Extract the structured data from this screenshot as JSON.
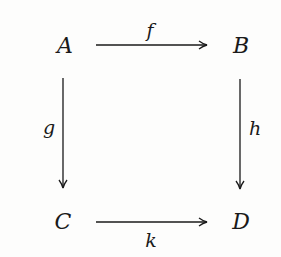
{
  "diagram": {
    "type": "commutative-square",
    "nodes": [
      {
        "id": "A",
        "label": "A",
        "x": 65,
        "y": 46
      },
      {
        "id": "B",
        "label": "B",
        "x": 241,
        "y": 46
      },
      {
        "id": "C",
        "label": "C",
        "x": 63,
        "y": 222
      },
      {
        "id": "D",
        "label": "D",
        "x": 241,
        "y": 222
      }
    ],
    "arrows": [
      {
        "from": "A",
        "to": "B",
        "label": "f",
        "label_pos": "above"
      },
      {
        "from": "A",
        "to": "C",
        "label": "g",
        "label_pos": "left"
      },
      {
        "from": "B",
        "to": "D",
        "label": "h",
        "label_pos": "right"
      },
      {
        "from": "C",
        "to": "D",
        "label": "k",
        "label_pos": "below"
      }
    ],
    "colors": {
      "ink": "#1a1a1a",
      "background": "#fdfdfc"
    }
  }
}
